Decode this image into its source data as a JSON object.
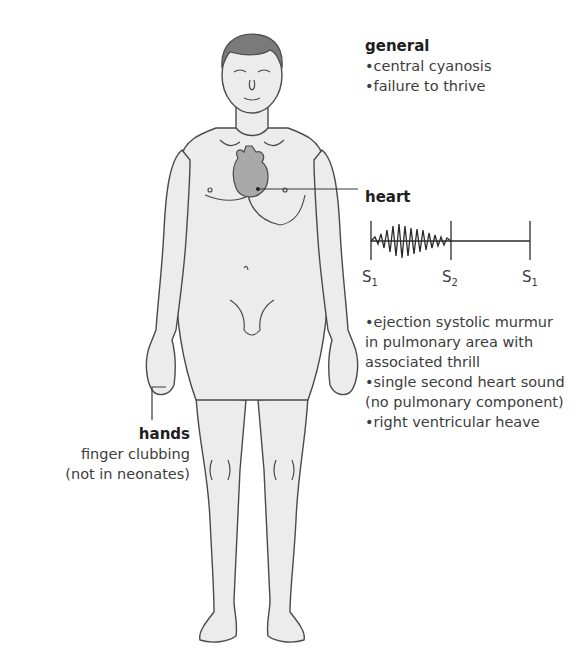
{
  "general": {
    "title": "general",
    "items": [
      "•central cyanosis",
      "•failure to thrive"
    ]
  },
  "heart": {
    "title": "heart",
    "phonocardiogram": {
      "markers": [
        {
          "label": "S",
          "sub": "1"
        },
        {
          "label": "S",
          "sub": "2"
        },
        {
          "label": "S",
          "sub": "1"
        }
      ],
      "murmur": "ejection systolic (crescendo-decrescendo) between S1 and S2"
    },
    "findings": [
      "•ejection systolic murmur in pulmonary area with associated thrill",
      "•single second heart sound (no pulmonary component)",
      "•right ventricular heave"
    ]
  },
  "hands": {
    "title": "hands",
    "lines": [
      "finger clubbing",
      "(not in neonates)"
    ]
  },
  "colors": {
    "body_fill": "#ececec",
    "outline": "#4a4a4a",
    "hair": "#7a7a7a",
    "heart_fill": "#a9a9a9",
    "text": "#3c3c3c"
  }
}
